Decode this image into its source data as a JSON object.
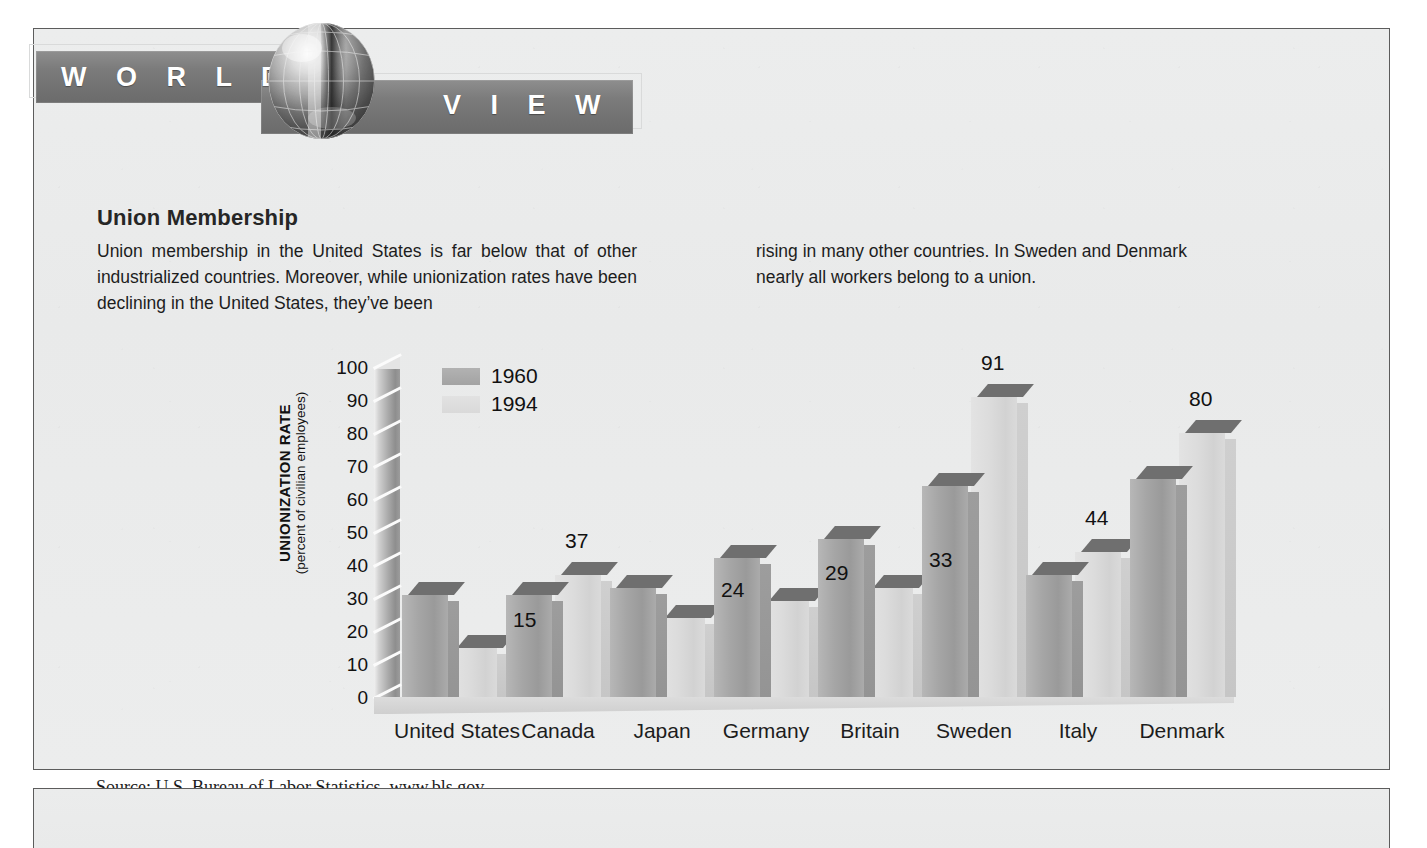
{
  "masthead": {
    "word_left": "W O R L D",
    "word_right": "V I E W",
    "globe_icon": "globe-icon"
  },
  "article": {
    "headline": "Union Membership",
    "column_left": "Union membership in the United States is far below that of other industrialized countries. Moreover, while unionization rates have been declining in the United States, they’ve been",
    "column_right": "rising in many other countries. In Sweden and Denmark nearly all workers belong to a union."
  },
  "source": "Source: U.S. Bureau of Labor Statistics. www.bls.gov",
  "chart_data": {
    "type": "bar",
    "title": "Union Membership",
    "xlabel": "",
    "ylabel": "UNIONIZATION RATE",
    "ylabel_sub": "(percent of civilian employees)",
    "ylim": [
      0,
      100
    ],
    "yticks": [
      100,
      90,
      80,
      70,
      60,
      50,
      40,
      30,
      20,
      10,
      0
    ],
    "grid": false,
    "legend_position": "top-left",
    "categories": [
      "United States",
      "Canada",
      "Japan",
      "Germany",
      "Britain",
      "Sweden",
      "Italy",
      "Denmark"
    ],
    "series": [
      {
        "name": "1960",
        "color": "#a6a6a6",
        "values": [
          31,
          31,
          33,
          42,
          48,
          64,
          37,
          66
        ]
      },
      {
        "name": "1994",
        "color": "#dcdcdc",
        "values": [
          15,
          37,
          24,
          29,
          33,
          91,
          44,
          80
        ]
      }
    ],
    "value_labels_shown": [
      "15",
      "37",
      "24",
      "29",
      "33",
      "91",
      "44",
      "80"
    ],
    "value_labels_series": "1994"
  },
  "colors": {
    "panel_bg": "#eceded",
    "panel_border": "#5c5c5c",
    "band": "#7b7b7b",
    "band_text": "#ffffff",
    "bar_1960": "#a6a6a6",
    "bar_1994": "#dcdcdc",
    "bar_top": "#6f6f6f",
    "text": "#1d1d1d"
  }
}
